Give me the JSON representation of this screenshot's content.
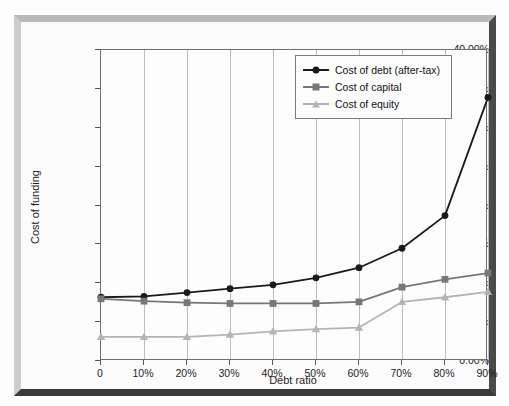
{
  "chart_data": {
    "type": "line",
    "title": "",
    "xlabel": "Debt ratio",
    "ylabel": "Cost of funding",
    "categories": [
      "0",
      "10%",
      "20%",
      "30%",
      "40%",
      "50%",
      "60%",
      "70%",
      "80%",
      "90%"
    ],
    "x_values": [
      0,
      10,
      20,
      30,
      40,
      50,
      60,
      70,
      80,
      90
    ],
    "ylim": [
      0,
      40
    ],
    "ytick_labels": [
      "0.00%",
      "5.00%",
      "10.00%",
      "15.00%",
      "20.00%",
      "25.00%",
      "30.00%",
      "35.00%",
      "40.00%"
    ],
    "ytick_values": [
      0,
      5,
      10,
      15,
      20,
      25,
      30,
      35,
      40
    ],
    "grid": "vertical",
    "legend_position": "top-right",
    "series": [
      {
        "name": "Cost of debt (after-tax)",
        "color": "#1a1a1a",
        "marker": "circle",
        "values": [
          8.2,
          8.3,
          8.8,
          9.3,
          9.8,
          10.7,
          12.0,
          14.5,
          18.7,
          33.9
        ]
      },
      {
        "name": "Cost of capital",
        "color": "#777777",
        "marker": "square",
        "values": [
          8.0,
          7.7,
          7.5,
          7.4,
          7.4,
          7.4,
          7.6,
          9.5,
          10.5,
          11.3
        ]
      },
      {
        "name": "Cost of equity",
        "color": "#b4b4b4",
        "marker": "triangle",
        "values": [
          3.1,
          3.1,
          3.1,
          3.4,
          3.8,
          4.1,
          4.3,
          7.6,
          8.2,
          8.9
        ]
      }
    ]
  },
  "legend": {
    "items": [
      {
        "label": "Cost of debt (after-tax)"
      },
      {
        "label": "Cost of capital"
      },
      {
        "label": "Cost of equity"
      }
    ]
  }
}
